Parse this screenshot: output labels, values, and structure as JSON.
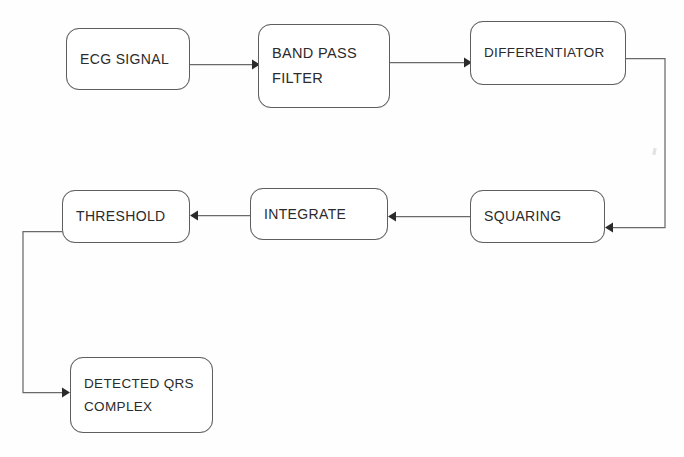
{
  "diagram": {
    "background_color": "#fefefe",
    "box_border_color": "#5e5e5e",
    "line_color": "#6a6a6a",
    "arrowhead_color": "#2a2a2a",
    "text_color": "#2b2b2b",
    "nodes": [
      {
        "id": "ecg-signal",
        "label_line1": "ECG SIGNAL",
        "label_line2": ""
      },
      {
        "id": "band-pass-filter",
        "label_line1": "BAND PASS",
        "label_line2": "FILTER"
      },
      {
        "id": "differentiator",
        "label_line1": "DIFFERENTIATOR",
        "label_line2": ""
      },
      {
        "id": "squaring",
        "label_line1": "SQUARING",
        "label_line2": ""
      },
      {
        "id": "integrate",
        "label_line1": "INTEGRATE",
        "label_line2": ""
      },
      {
        "id": "threshold",
        "label_line1": "THRESHOLD",
        "label_line2": ""
      },
      {
        "id": "detected-qrs",
        "label_line1": "DETECTED QRS",
        "label_line2": "COMPLEX"
      }
    ],
    "edges": [
      {
        "id": "ecg-to-bandpass",
        "from": "ecg-signal",
        "to": "band-pass-filter"
      },
      {
        "id": "bandpass-to-differentiator",
        "from": "band-pass-filter",
        "to": "differentiator"
      },
      {
        "id": "differentiator-to-squaring",
        "from": "differentiator",
        "to": "squaring"
      },
      {
        "id": "squaring-to-integrate",
        "from": "squaring",
        "to": "integrate"
      },
      {
        "id": "integrate-to-threshold",
        "from": "integrate",
        "to": "threshold"
      },
      {
        "id": "threshold-to-detected-qrs",
        "from": "threshold",
        "to": "detected-qrs"
      }
    ]
  }
}
